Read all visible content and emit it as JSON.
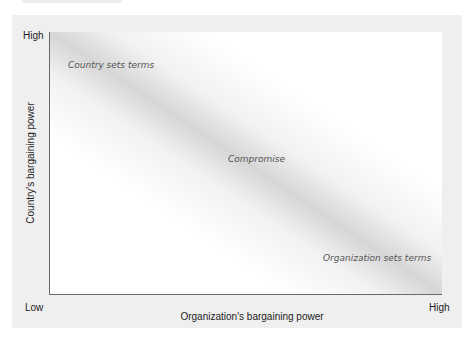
{
  "diagram": {
    "type": "two-axis bargaining power diagram",
    "y_axis": {
      "label": "Country's bargaining power",
      "low": "Low",
      "high": "High"
    },
    "x_axis": {
      "label": "Organization's bargaining power",
      "low": "Low",
      "high": "High"
    },
    "regions": {
      "top_left": "Country sets terms",
      "center": "Compromise",
      "bottom_right": "Organization sets terms"
    }
  }
}
